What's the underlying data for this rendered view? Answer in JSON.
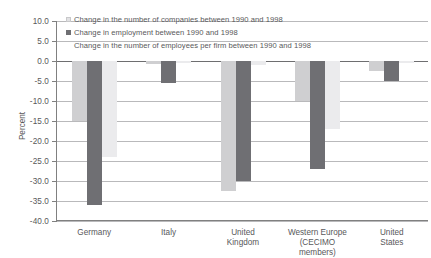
{
  "chart_data": {
    "type": "bar",
    "title": "",
    "subtitle": "",
    "xlabel": "",
    "ylabel": "Percent",
    "ylim": [
      -40.0,
      10.0
    ],
    "ytick_step": 5.0,
    "ytick_labels": [
      "10.0",
      "5.0",
      "0.0",
      "-5.0",
      "-10.0",
      "-15.0",
      "-20.0",
      "-25.0",
      "-30.0",
      "-35.0",
      "-40.0"
    ],
    "ytick_values": [
      10.0,
      5.0,
      0.0,
      -5.0,
      -10.0,
      -15.0,
      -20.0,
      -25.0,
      -30.0,
      -35.0,
      -40.0
    ],
    "grid": true,
    "grid_axis": "y",
    "legend_position": "top-left",
    "categories": [
      "Germany",
      "Italy",
      "United Kingdom",
      "Western Europe (CECIMO members)",
      "United States"
    ],
    "category_lines": [
      [
        "Germany"
      ],
      [
        "Italy"
      ],
      [
        "United",
        "Kingdom"
      ],
      [
        "Western Europe",
        "(CECIMO members)"
      ],
      [
        "United",
        "States"
      ]
    ],
    "series": [
      {
        "name": "Change in the number of companies between 1990 and 1998",
        "color": "#cfcfd1",
        "values": [
          -15.0,
          -0.8,
          -32.5,
          -10.0,
          -2.5
        ]
      },
      {
        "name": "Change in employment between 1990 and 1998",
        "color": "#6f6f73",
        "values": [
          -36.0,
          -5.5,
          -30.0,
          -27.0,
          -5.0
        ]
      },
      {
        "name": "Change in the number of employees per firm between 1990 and 1998",
        "color": "#ebebed",
        "values": [
          -24.0,
          -0.5,
          -1.0,
          -17.0,
          -0.6
        ]
      }
    ]
  }
}
